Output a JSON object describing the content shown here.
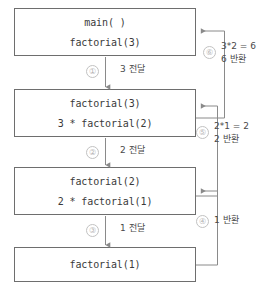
{
  "diagram": {
    "line_color": "#6e6e6e",
    "arrow_color": "#8a8a8a",
    "circle_color": "#c2c2c2",
    "text_color": "#3a3a3a",
    "frames": [
      {
        "name": "main-frame",
        "top_line": "main( )",
        "bottom_line": "factorial(3)"
      },
      {
        "name": "factorial3-frame",
        "top_line": "factorial(3)",
        "bottom_line": "3 * factorial(2)"
      },
      {
        "name": "factorial2-frame",
        "top_line": "factorial(2)",
        "bottom_line": "2 * factorial(1)"
      },
      {
        "name": "factorial1-frame",
        "top_line": "factorial(1)",
        "bottom_line": ""
      }
    ],
    "pass_arrows": [
      {
        "marker": "①",
        "label": "3 전달"
      },
      {
        "marker": "②",
        "label": "2 전달"
      },
      {
        "marker": "③",
        "label": "1 전달"
      }
    ],
    "return_arrows": [
      {
        "marker": "⑥",
        "line1": "3*2 = 6",
        "line2": "6 반환"
      },
      {
        "marker": "⑤",
        "line1": "2*1 = 2",
        "line2": "2 반환"
      },
      {
        "marker": "④",
        "line1": "1 반환",
        "line2": ""
      }
    ]
  }
}
